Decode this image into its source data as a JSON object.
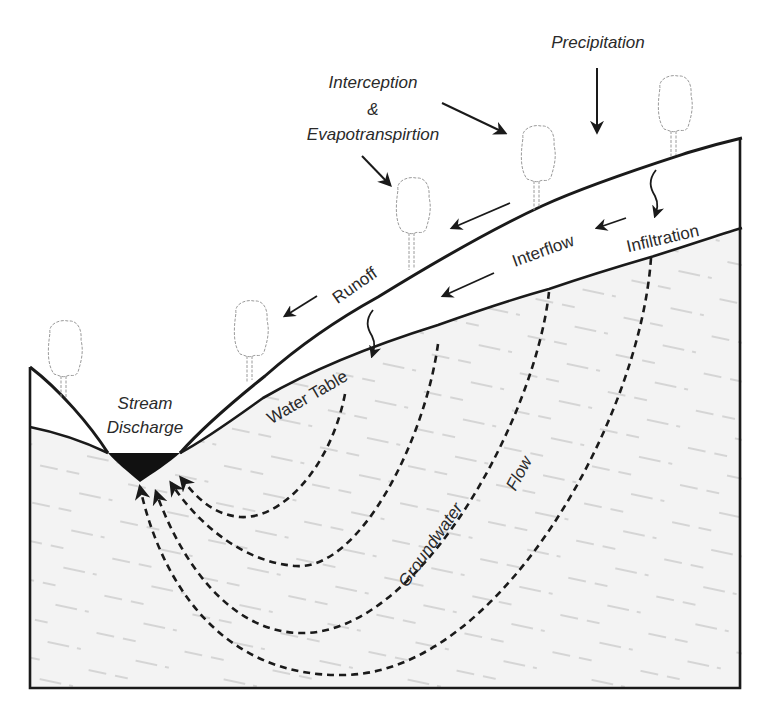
{
  "colors": {
    "line": "#1a1a1a",
    "ground_fill": "#f2f2f2",
    "hatch": "#b8b8b8",
    "tree": "#9a9a9a",
    "stream": "#111111",
    "text": "#2a2a2a"
  },
  "labels": {
    "precipitation": "Precipitation",
    "interception_1": "Interception",
    "interception_2": "&",
    "interception_3": "Evapotranspirtion",
    "runoff": "Runoff",
    "interflow": "Interflow",
    "infiltration": "Infiltration",
    "water_table": "Water Table",
    "stream_1": "Stream",
    "stream_2": "Discharge",
    "groundwater": "Groundwater",
    "flow": "Flow"
  },
  "components": [
    "land-surface",
    "water-table",
    "unsaturated-zone",
    "saturated-zone",
    "stream-channel",
    "groundwater-flow-paths",
    "trees"
  ],
  "flows": [
    {
      "name": "Precipitation",
      "direction": "down"
    },
    {
      "name": "Interception & Evapotranspirtion",
      "direction": "toward trees"
    },
    {
      "name": "Runoff",
      "direction": "downslope along surface"
    },
    {
      "name": "Infiltration",
      "direction": "down into soil"
    },
    {
      "name": "Interflow",
      "direction": "downslope in unsaturated zone"
    },
    {
      "name": "Groundwater Flow",
      "direction": "curved paths to stream"
    },
    {
      "name": "Stream Discharge",
      "direction": "out of stream"
    }
  ]
}
